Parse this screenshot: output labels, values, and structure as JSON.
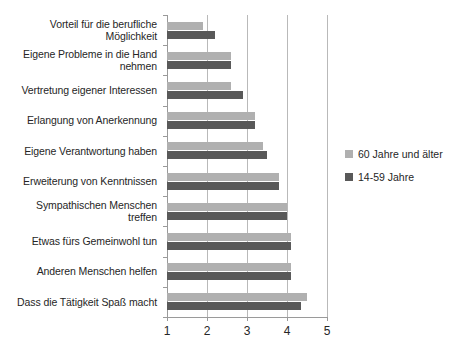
{
  "chart_data": {
    "type": "bar",
    "orientation": "horizontal",
    "title": "",
    "subtitle": "",
    "xlabel": "",
    "ylabel": "",
    "xlim": [
      1,
      5
    ],
    "xticks": [
      1,
      2,
      3,
      4,
      5
    ],
    "xtick_labels": [
      "1",
      "2",
      "3",
      "4",
      "5"
    ],
    "grid": true,
    "grid_axis": "x",
    "legend_position": "right",
    "categories": [
      "Vorteil für die berufliche Möglichkeit",
      "Eigene Probleme in die Hand nehmen",
      "Vertretung eigener Interessen",
      "Erlangung von Anerkennung",
      "Eigene Verantwortung haben",
      "Erweiterung von Kenntnissen",
      "Sympathischen Menschen treffen",
      "Etwas fürs Gemeinwohl tun",
      "Anderen Menschen helfen",
      "Dass die Tätigkeit Spaß macht"
    ],
    "series": [
      {
        "name": "60 Jahre und älter",
        "color": "#b0b0b0",
        "values": [
          1.9,
          2.6,
          2.6,
          3.2,
          3.4,
          3.8,
          4.0,
          4.1,
          4.1,
          4.5
        ]
      },
      {
        "name": "14-59 Jahre",
        "color": "#595959",
        "values": [
          2.2,
          2.6,
          2.9,
          3.2,
          3.5,
          3.8,
          4.0,
          4.1,
          4.1,
          4.35
        ]
      }
    ]
  },
  "legend": {
    "entries": [
      {
        "label": "60 Jahre und älter",
        "swatch": "older"
      },
      {
        "label": "14-59 Jahre",
        "swatch": "younger"
      }
    ]
  }
}
